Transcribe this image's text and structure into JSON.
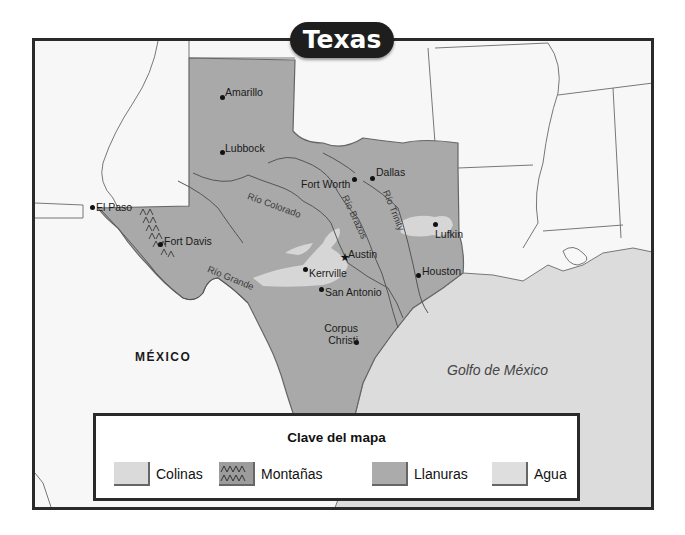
{
  "title": "Texas",
  "regions": {
    "country_label": "MÉXICO",
    "gulf_label": "Golfo de México"
  },
  "cities": [
    {
      "name": "Amarillo",
      "x": 222,
      "y": 96
    },
    {
      "name": "Lubbock",
      "x": 222,
      "y": 151
    },
    {
      "name": "Dallas",
      "x": 372,
      "y": 177
    },
    {
      "name": "Fort Worth",
      "x": 354,
      "y": 178
    },
    {
      "name": "El Paso",
      "x": 92,
      "y": 207
    },
    {
      "name": "Fort Davis",
      "x": 160,
      "y": 243
    },
    {
      "name": "Lufkin",
      "x": 435,
      "y": 223
    },
    {
      "name": "Austin",
      "x": 345,
      "y": 259
    },
    {
      "name": "Kerrville",
      "x": 305,
      "y": 268
    },
    {
      "name": "Houston",
      "x": 418,
      "y": 274
    },
    {
      "name": "San Antonio",
      "x": 321,
      "y": 288
    },
    {
      "name": "Corpus Christi",
      "x": 356,
      "y": 341
    }
  ],
  "capital": "Austin",
  "rivers": [
    {
      "name": "Río Colorado"
    },
    {
      "name": "Río Brazos"
    },
    {
      "name": "Río Trinity"
    },
    {
      "name": "Río Grande"
    }
  ],
  "legend": {
    "title": "Clave del mapa",
    "items": [
      {
        "label": "Colinas",
        "color": "#d9d9d9"
      },
      {
        "label": "Montañas",
        "color": "#9a9a9a",
        "pattern": "mountain"
      },
      {
        "label": "Llanuras",
        "color": "#a9a9a9"
      },
      {
        "label": "Agua",
        "color": "#dddddd"
      }
    ]
  },
  "colors": {
    "plains": "#a9a9a9",
    "hills": "#d6d6d6",
    "water": "#dcdcdc",
    "land": "#f8f8f8",
    "border": "#2a2a2a"
  }
}
